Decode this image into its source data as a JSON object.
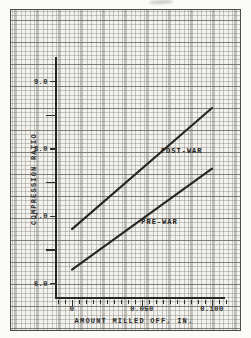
{
  "chart_data": {
    "type": "line",
    "title": "",
    "xlabel": "AMOUNT MILLED OFF, IN.",
    "ylabel": "COMPRESSION RATIO",
    "xlim": [
      0,
      0.1
    ],
    "ylim": [
      6.0,
      9.0
    ],
    "grid": true,
    "legend_position": "inline-labels-on-lines",
    "x_tick_labels": [
      {
        "value": 0,
        "label": "0"
      },
      {
        "value": 0.05,
        "label": "0.050"
      },
      {
        "value": 0.1,
        "label": "0.100"
      }
    ],
    "x_minor_ticks": {
      "start": -0.01,
      "end": 0.11,
      "step": 0.005
    },
    "y_tick_labels": [
      {
        "value": 9.0,
        "label": "9.0"
      },
      {
        "value": 8.0,
        "label": "8.0"
      },
      {
        "value": 7.0,
        "label": "7.0"
      },
      {
        "value": 6.0,
        "label": "6.0"
      }
    ],
    "y_minor_ticks": [
      8.5,
      7.5,
      6.5
    ],
    "series": [
      {
        "name": "POST-WAR",
        "points": [
          [
            0,
            6.8
          ],
          [
            0.1,
            8.6
          ]
        ],
        "label_at": {
          "x": 0.0635,
          "y": 7.96
        }
      },
      {
        "name": "PRE-WAR",
        "points": [
          [
            0,
            6.2
          ],
          [
            0.1,
            7.7
          ]
        ],
        "label_at": {
          "x": 0.0495,
          "y": 6.91
        }
      }
    ],
    "colors": {
      "line": "#262624",
      "text": "#2b2b29",
      "paper": "#f3f2ee",
      "grid_minor": "#8c8b84",
      "grid_major": "#696862",
      "border": "#4d4c48"
    }
  }
}
